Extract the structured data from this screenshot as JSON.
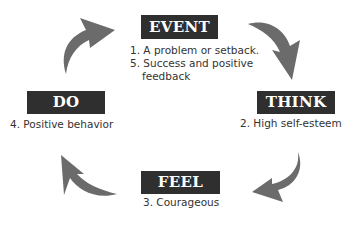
{
  "diagram": {
    "type": "cycle",
    "colors": {
      "box": "#2f2f2f",
      "box_text": "#ffffff",
      "arrow": "#6b6b6b",
      "text": "#333333"
    },
    "stages": [
      {
        "id": "event",
        "title": "EVENT",
        "lines": [
          "1. A problem or setback.",
          "5. Success and positive",
          "feedback"
        ]
      },
      {
        "id": "think",
        "title": "THINK",
        "lines": [
          "2. High self-esteem"
        ]
      },
      {
        "id": "feel",
        "title": "FEEL",
        "lines": [
          "3. Courageous"
        ]
      },
      {
        "id": "do",
        "title": "DO",
        "lines": [
          "4. Positive behavior"
        ]
      }
    ],
    "arrows": [
      {
        "from": "do",
        "to": "event",
        "direction": "clockwise"
      },
      {
        "from": "event",
        "to": "think",
        "direction": "clockwise"
      },
      {
        "from": "think",
        "to": "feel",
        "direction": "clockwise"
      },
      {
        "from": "feel",
        "to": "do",
        "direction": "clockwise"
      }
    ]
  }
}
